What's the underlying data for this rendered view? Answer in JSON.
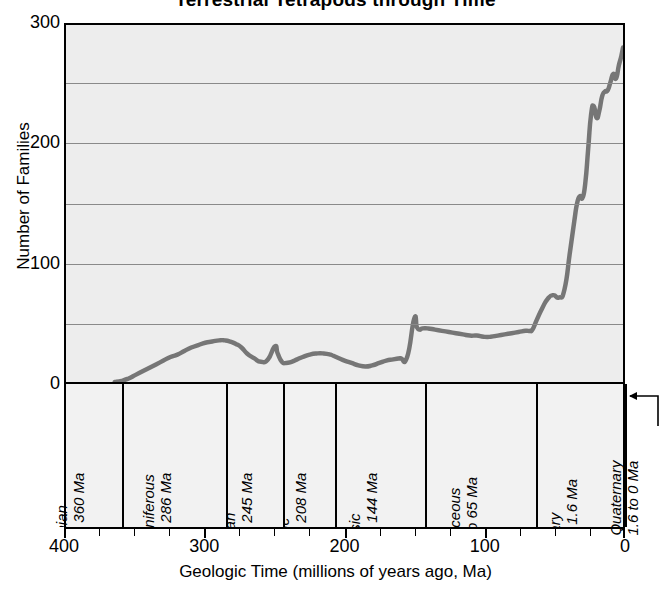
{
  "chart_data": {
    "type": "line",
    "title": "Terrestrial Tetrapods through Time",
    "xlabel": "Geologic Time (millions of years ago, Ma)",
    "ylabel": "Number of Families",
    "xlim": [
      400,
      0
    ],
    "ylim": [
      0,
      300
    ],
    "x_reversed": true,
    "grid": true,
    "legend": "none",
    "y_ticks": [
      0,
      100,
      200,
      300
    ],
    "y_tick_labels": [
      "0",
      "100",
      "200",
      "300"
    ],
    "y_gridlines": [
      50,
      100,
      150,
      200,
      250
    ],
    "x_ticks": [
      400,
      300,
      200,
      100,
      0
    ],
    "x_tick_labels": [
      "400",
      "300",
      "200",
      "100",
      "0"
    ],
    "x_minor_tick_step": 25,
    "series_name": "Number of tetrapod families",
    "line_color": "#767676",
    "plot_background": "#ededed",
    "x": [
      365,
      360,
      355,
      350,
      345,
      340,
      335,
      330,
      325,
      320,
      315,
      310,
      305,
      300,
      295,
      290,
      286,
      282,
      278,
      274,
      270,
      265,
      260,
      255,
      250,
      248,
      245,
      242,
      238,
      234,
      230,
      225,
      220,
      215,
      210,
      208,
      204,
      200,
      195,
      190,
      185,
      180,
      175,
      170,
      165,
      160,
      155,
      150,
      148,
      146,
      144,
      140,
      135,
      130,
      125,
      120,
      115,
      110,
      105,
      100,
      95,
      90,
      85,
      80,
      75,
      70,
      67,
      65,
      62,
      58,
      54,
      50,
      46,
      42,
      38,
      35,
      33,
      31,
      29,
      27,
      25,
      23,
      21,
      19,
      17,
      15,
      13,
      11,
      9,
      7,
      5,
      3,
      1.6,
      1,
      0
    ],
    "y": [
      0,
      1,
      3,
      6,
      9,
      12,
      15,
      18,
      21,
      23,
      26,
      29,
      31,
      33,
      34,
      35,
      35,
      34,
      32,
      29,
      24,
      20,
      17,
      19,
      30,
      24,
      17,
      16,
      17,
      19,
      21,
      23,
      24,
      24,
      23,
      22,
      20,
      18,
      16,
      14,
      13,
      14,
      16,
      18,
      19,
      20,
      21,
      53,
      46,
      44,
      45,
      45,
      44,
      43,
      42,
      41,
      40,
      39,
      39,
      38,
      38,
      39,
      40,
      41,
      42,
      43,
      43,
      44,
      52,
      62,
      70,
      73,
      71,
      78,
      110,
      135,
      150,
      156,
      155,
      168,
      196,
      224,
      232,
      222,
      228,
      240,
      244,
      245,
      252,
      259,
      255,
      266,
      272,
      275,
      281
    ],
    "periods": [
      {
        "name": "Devonian",
        "range_label": "408 to 360 Ma",
        "start": 408,
        "end": 360
      },
      {
        "name": "Carboniferous",
        "range_label": "360 to 286 Ma",
        "start": 360,
        "end": 286
      },
      {
        "name": "Permian",
        "range_label": "286 to 245 Ma",
        "start": 286,
        "end": 245
      },
      {
        "name": "Triassic",
        "range_label": "245 to 208 Ma",
        "start": 245,
        "end": 208
      },
      {
        "name": "Jurassic",
        "range_label": "208 to 144 Ma",
        "start": 208,
        "end": 144
      },
      {
        "name": "Cretaceous",
        "range_label": "144 to 65 Ma",
        "start": 144,
        "end": 65
      },
      {
        "name": "Tertiary",
        "range_label": "65 to 1.6 Ma",
        "start": 65,
        "end": 1.6
      },
      {
        "name": "Quaternary",
        "range_label": "1.6 to 0 Ma",
        "start": 1.6,
        "end": 0,
        "callout": true
      }
    ]
  },
  "chart": {
    "title": "Terrestrial Tetrapods through Time",
    "x_axis_title": "Geologic Time (millions of years ago, Ma)",
    "y_axis_title": "Number of Families",
    "quaternary": {
      "name": "Quaternary",
      "range_label": "1.6 to 0 Ma"
    }
  }
}
